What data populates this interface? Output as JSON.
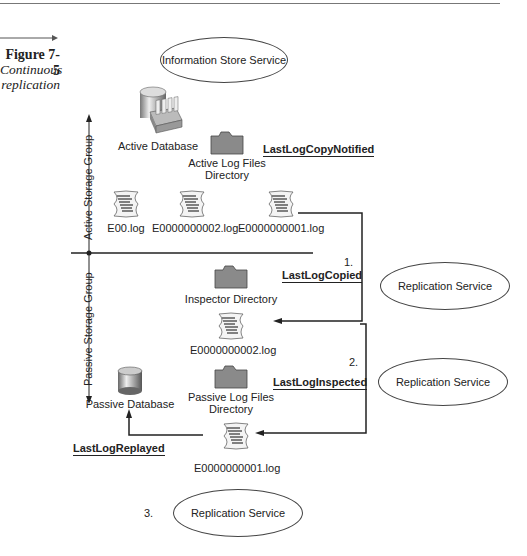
{
  "figure": {
    "number": "Figure 7-5",
    "caption_line1": "Continuous",
    "caption_line2": "replication"
  },
  "services": {
    "information_store": "Information Store Service",
    "replication_1": "Replication Service",
    "replication_2": "Replication Service",
    "replication_3": "Replication Service"
  },
  "axis": {
    "active_group": "Active Storage Group",
    "passive_group": "Passive Storage Group"
  },
  "active": {
    "database": "Active Database",
    "log_dir_line1": "Active Log Files",
    "log_dir_line2": "Directory",
    "logs": [
      "E00.log",
      "E0000000002.log",
      "E0000000001.log"
    ],
    "marker": "LastLogCopyNotified"
  },
  "passive": {
    "inspector_dir": "Inspector Directory",
    "inspector_log": "E0000000002.log",
    "log_dir_line1": "Passive Log Files",
    "log_dir_line2": "Directory",
    "passive_log": "E0000000001.log",
    "database": "Passive Database"
  },
  "steps": {
    "step1_num": "1.",
    "step1_marker": "LastLogCopied",
    "step2_num": "2.",
    "step2_marker": "LastLogInspected",
    "step3_num": "3.",
    "step3_marker": "LastLogReplayed"
  },
  "colors": {
    "line": "#222222",
    "folder": "#8a8a8a",
    "background": "#ffffff"
  }
}
